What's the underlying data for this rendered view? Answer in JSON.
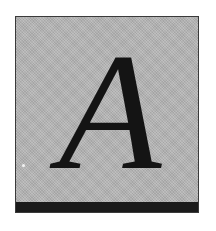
{
  "initial": {
    "letter": "A",
    "style": "italic serif drop-cap",
    "colors": {
      "background": "#b5b5b5",
      "letter": "#141414",
      "border": "#3a3a3a",
      "bottom_bar": "#1a1a1a"
    }
  }
}
